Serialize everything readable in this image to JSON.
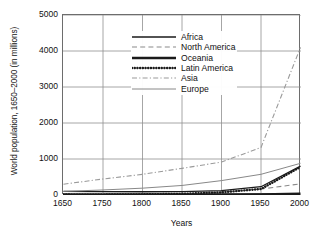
{
  "chart_data": {
    "type": "line",
    "title": "",
    "xlabel": "Years",
    "ylabel": "World population, 1650–2000 (in millions)",
    "categories": [
      "1650",
      "1750",
      "1800",
      "1850",
      "1900",
      "1950",
      "2000"
    ],
    "x": [
      1650,
      1750,
      1800,
      1850,
      1900,
      1950,
      2000
    ],
    "xtick_labels": [
      "1650",
      "1750",
      "1800",
      "1850",
      "1900",
      "1950",
      "2000"
    ],
    "ytick_labels": [
      "0",
      "1000",
      "2000",
      "3000",
      "4000",
      "5000"
    ],
    "yticks": [
      0,
      1000,
      2000,
      3000,
      4000,
      5000
    ],
    "ylim": [
      0,
      5000
    ],
    "x_axis_scale": "categorical-even-spacing",
    "grid": true,
    "legend_position": "upper-left-inside",
    "units": "millions of people",
    "series": [
      {
        "name": "Africa",
        "values": [
          100,
          95,
          90,
          95,
          120,
          230,
          800
        ],
        "style": "solid",
        "width": 1.3,
        "color": "#1a1a1a"
      },
      {
        "name": "North America",
        "values": [
          5,
          5,
          10,
          25,
          80,
          165,
          310
        ],
        "style": "dashed",
        "width": 1.1,
        "color": "#8a8a8a"
      },
      {
        "name": "Oceania",
        "values": [
          2,
          2,
          2,
          2,
          6,
          13,
          30
        ],
        "style": "solid",
        "width": 2.6,
        "color": "#1a1a1a"
      },
      {
        "name": "Latin America",
        "values": [
          12,
          11,
          19,
          33,
          74,
          166,
          780
        ],
        "style": "dotted",
        "width": 2.4,
        "color": "#1a1a1a"
      },
      {
        "name": "Asia",
        "values": [
          300,
          445,
          575,
          740,
          915,
          1320,
          4100
        ],
        "style": "dashdot",
        "width": 1.1,
        "color": "#9a9a9a"
      },
      {
        "name": "Europe",
        "values": [
          100,
          140,
          190,
          265,
          400,
          575,
          880
        ],
        "style": "solid",
        "width": 1.0,
        "color": "#888888"
      }
    ]
  },
  "legend": {
    "entries": [
      "Africa",
      "North America",
      "Oceania",
      "Latin America",
      "Asia",
      "Europe"
    ]
  },
  "colors": {
    "background": "#ffffff",
    "axis": "#6d6d6d",
    "grid": "#8f8f8f",
    "text": "#111111"
  }
}
